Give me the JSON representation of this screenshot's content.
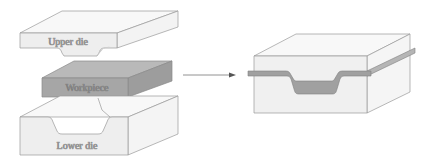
{
  "diagram": {
    "labels": {
      "upper_die": "Upper die",
      "workpiece": "Workpiece",
      "lower_die": "Lower die"
    },
    "colors": {
      "die_face": "#eeeeee",
      "die_top": "#f8f8f8",
      "die_side": "#f4f4f4",
      "workpiece_face": "#a6a6a6",
      "workpiece_top": "#b9b9b9",
      "workpiece_side": "#999999",
      "outline": "#9a9a9a",
      "arrow": "#666666"
    }
  }
}
